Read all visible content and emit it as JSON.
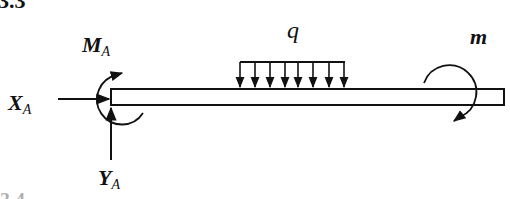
{
  "figure": {
    "number_top": "3.3",
    "number_bottom": "3.4"
  },
  "labels": {
    "moment_A": {
      "main": "M",
      "sub": "A"
    },
    "force_X": {
      "main": "X",
      "sub": "A"
    },
    "force_Y": {
      "main": "Y",
      "sub": "A"
    },
    "distributed_load": "q",
    "applied_moment": "m"
  },
  "diagram": {
    "beam": {
      "x1": 111,
      "x2": 504,
      "y_top": 89,
      "y_bottom": 105
    },
    "distributed_load_arrows": 8,
    "colors": {
      "stroke": "#111111",
      "background": "#ffffff"
    }
  }
}
